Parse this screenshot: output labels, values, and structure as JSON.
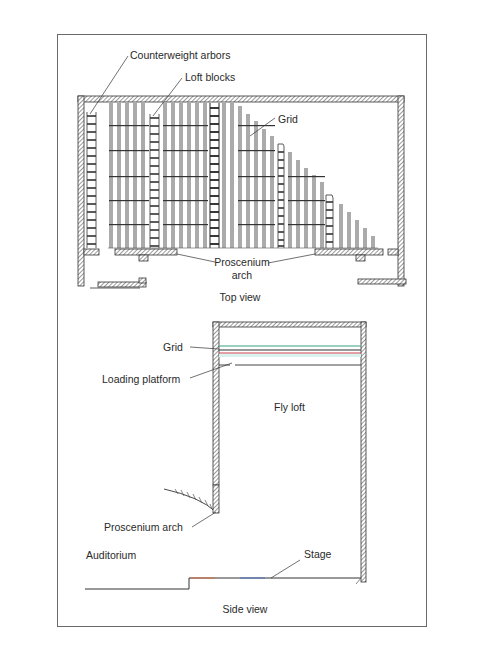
{
  "figure": {
    "top_view": {
      "caption": "Top view",
      "labels": {
        "counterweight_arbors": "Counterweight arbors",
        "loft_blocks": "Loft blocks",
        "grid": "Grid",
        "proscenium_arch_line1": "Proscenium",
        "proscenium_arch_line2": "arch"
      }
    },
    "side_view": {
      "caption": "Side view",
      "labels": {
        "grid": "Grid",
        "loading_platform": "Loading platform",
        "fly_loft": "Fly loft",
        "proscenium_arch": "Proscenium arch",
        "auditorium": "Auditorium",
        "stage": "Stage"
      }
    },
    "colors": {
      "line": "#333333",
      "hatch": "#555555",
      "frame": "#6a6a6a",
      "grid_line_green": "#3aa07a",
      "grid_line_red": "#c8404a",
      "grid_line_teal": "#60c8b8",
      "stage_orange": "#d86a3a",
      "stage_blue": "#4a70c0"
    }
  }
}
